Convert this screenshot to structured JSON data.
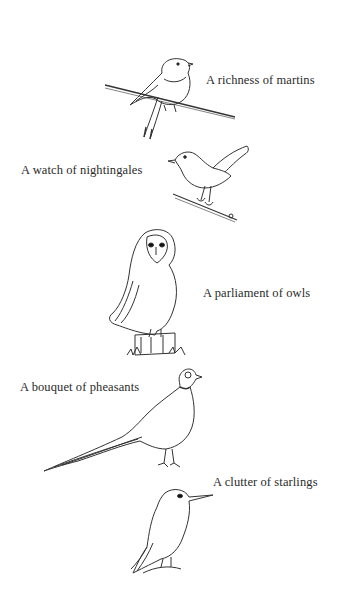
{
  "entries": [
    {
      "bird": "martin",
      "caption": "A richness of martins"
    },
    {
      "bird": "nightingale",
      "caption": "A watch of nightingales"
    },
    {
      "bird": "owl",
      "caption": "A parliament of owls"
    },
    {
      "bird": "pheasant",
      "caption": "A bouquet of pheasants"
    },
    {
      "bird": "starling",
      "caption": "A clutter of starlings"
    }
  ],
  "colors": {
    "ink": "#2a2a2a",
    "background": "#ffffff"
  }
}
